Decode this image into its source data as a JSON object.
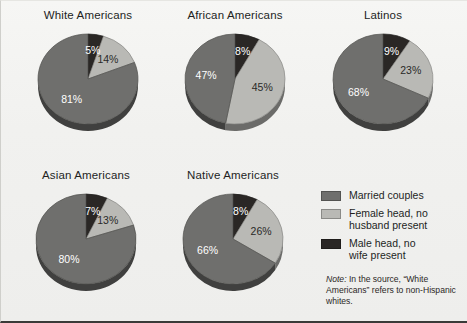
{
  "chart_data": {
    "type": "pie",
    "title": "",
    "categories": [
      "Married couples",
      "Female head, no husband present",
      "Male head, no wife present"
    ],
    "legend_position": "bottom-right",
    "colors": {
      "married_couples": "#6f6f6d",
      "female_head": "#b9b9b5",
      "male_head": "#2a2725"
    },
    "charts": [
      {
        "title": "White Americans",
        "slices": [
          {
            "label": "Male head, no wife present",
            "value": 5,
            "display": "5%"
          },
          {
            "label": "Female head, no husband present",
            "value": 14,
            "display": "14%"
          },
          {
            "label": "Married couples",
            "value": 81,
            "display": "81%"
          }
        ]
      },
      {
        "title": "African Americans",
        "slices": [
          {
            "label": "Male head, no wife present",
            "value": 8,
            "display": "8%"
          },
          {
            "label": "Female head, no husband present",
            "value": 45,
            "display": "45%"
          },
          {
            "label": "Married couples",
            "value": 47,
            "display": "47%"
          }
        ]
      },
      {
        "title": "Latinos",
        "slices": [
          {
            "label": "Male head, no wife present",
            "value": 9,
            "display": "9%"
          },
          {
            "label": "Female head, no husband present",
            "value": 23,
            "display": "23%"
          },
          {
            "label": "Married couples",
            "value": 68,
            "display": "68%"
          }
        ]
      },
      {
        "title": "Asian Americans",
        "slices": [
          {
            "label": "Male head, no wife present",
            "value": 7,
            "display": "7%"
          },
          {
            "label": "Female head, no husband present",
            "value": 13,
            "display": "13%"
          },
          {
            "label": "Married couples",
            "value": 80,
            "display": "80%"
          }
        ]
      },
      {
        "title": "Native Americans",
        "slices": [
          {
            "label": "Male head, no wife present",
            "value": 8,
            "display": "8%"
          },
          {
            "label": "Female head, no husband present",
            "value": 26,
            "display": "26%"
          },
          {
            "label": "Married couples",
            "value": 66,
            "display": "66%"
          }
        ]
      }
    ],
    "note": "In the source, \"White Americans\" refers to non-Hispanic whites."
  },
  "panels": {
    "white": {
      "title": "White Americans",
      "male": "5%",
      "female": "14%",
      "married": "81%"
    },
    "african": {
      "title": "African Americans",
      "male": "8%",
      "female": "45%",
      "married": "47%"
    },
    "latinos": {
      "title": "Latinos",
      "male": "9%",
      "female": "23%",
      "married": "68%"
    },
    "asian": {
      "title": "Asian Americans",
      "male": "7%",
      "female": "13%",
      "married": "80%"
    },
    "native": {
      "title": "Native Americans",
      "male": "8%",
      "female": "26%",
      "married": "66%"
    }
  },
  "legend": {
    "items": [
      {
        "label": "Married couples",
        "color": "#6f6f6d"
      },
      {
        "label": "Female head, no\nhusband present",
        "color": "#b9b9b5"
      },
      {
        "label": "Male head, no\nwife present",
        "color": "#2a2725"
      }
    ],
    "item1_label": "Married couples",
    "item2_line1": "Female head, no",
    "item2_line2": "husband present",
    "item3_line1": "Male head, no",
    "item3_line2": "wife present"
  },
  "note": {
    "word": "Note:",
    "text": " In the source, “White Americans” refers to non-Hispanic whites."
  }
}
